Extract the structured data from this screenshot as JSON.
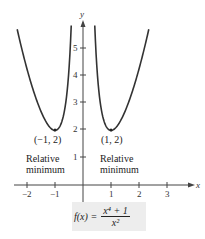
{
  "chart_data": {
    "type": "line",
    "title": "",
    "function": "f(x) = (x^4 + 1) / x^2",
    "xlabel": "x",
    "ylabel": "y",
    "xlim": [
      -2.4,
      3.7
    ],
    "ylim": [
      -0.4,
      5.8
    ],
    "x_ticks": [
      -2,
      -1,
      1,
      2,
      3
    ],
    "y_ticks": [
      1,
      2,
      3,
      4,
      5
    ],
    "series": [
      {
        "name": "f(x) left branch",
        "x": [
          -2.35,
          -2,
          -1.5,
          -1,
          -0.75,
          -0.5,
          -0.42
        ],
        "y": [
          5.69,
          4.25,
          2.69,
          2.0,
          2.34,
          4.25,
          5.84
        ]
      },
      {
        "name": "f(x) right branch",
        "x": [
          0.42,
          0.5,
          0.75,
          1,
          1.5,
          2,
          2.35
        ],
        "y": [
          5.84,
          4.25,
          2.34,
          2.0,
          2.69,
          4.25,
          5.69
        ]
      }
    ],
    "annotations": [
      {
        "point": [
          -1,
          2
        ],
        "label": "(−1, 2)",
        "note": "Relative minimum"
      },
      {
        "point": [
          1,
          2
        ],
        "label": "(1, 2)",
        "note": "Relative minimum"
      }
    ],
    "grid": false,
    "legend": "none"
  },
  "labels": {
    "x_axis": "x",
    "y_axis": "y",
    "xticks": [
      "−2",
      "−1",
      "1",
      "2",
      "3"
    ],
    "yticks": [
      "1",
      "2",
      "3",
      "4",
      "5"
    ],
    "left_point": "(−1, 2)",
    "right_point": "(1, 2)",
    "rel_line1": "Relative",
    "rel_line2": "minimum"
  },
  "formula": {
    "lhs": "f(x) =",
    "numerator": "x⁴ + 1",
    "denominator": "x²"
  }
}
